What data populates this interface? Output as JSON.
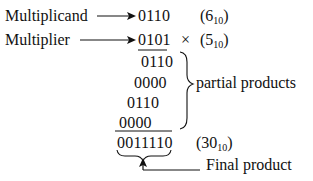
{
  "diagram": {
    "labels": {
      "multiplicand": "Multiplicand",
      "multiplier": "Multiplier",
      "partial_products": "partial products",
      "final_product": "Final product"
    },
    "multiplicand": {
      "binary": "0110",
      "decimal_value": "6",
      "base": "10"
    },
    "multiplier": {
      "binary": "0101",
      "operator": "×",
      "decimal_value": "5",
      "base": "10"
    },
    "partial_products": [
      "0110",
      "0000",
      "0110",
      "0000"
    ],
    "result": {
      "binary": "0011110",
      "decimal_value": "30",
      "base": "10"
    }
  }
}
